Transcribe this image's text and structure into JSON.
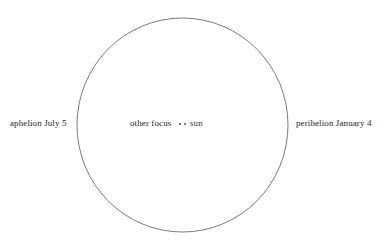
{
  "figure": {
    "background_color": "#ffffff",
    "width": 385,
    "height": 247
  },
  "orbit": {
    "shape": "ellipse",
    "stroke_color": "#6e6c6c",
    "stroke_width": 0.9,
    "fill": "none",
    "center_x": 182.5,
    "center_y": 125,
    "radius_x": 105.5,
    "radius_y": 107
  },
  "labels": {
    "aphelion": "aphelion July 5",
    "perihelion": "perihelion January 4",
    "other_focus": "other focus",
    "sun": "sun"
  },
  "foci": [
    {
      "name": "other-focus",
      "marker": "dot",
      "color": "#4a4848"
    },
    {
      "name": "sun",
      "marker": "dot",
      "color": "#4a4848"
    }
  ],
  "chart_data": {
    "type": "scatter",
    "xlabel": "",
    "ylabel": "",
    "annotations": [
      {
        "text": "aphelion July 5",
        "position": "left-outside",
        "x": 10,
        "y": 124
      },
      {
        "text": "other focus",
        "position": "center-left",
        "x": 130,
        "y": 124
      },
      {
        "text": "sun",
        "position": "center-right",
        "x": 190,
        "y": 124
      },
      {
        "text": "perihelion January 4",
        "position": "right-outside",
        "x": 296,
        "y": 124
      }
    ],
    "series": [
      {
        "name": "orbit path",
        "type": "ellipse",
        "center": [
          182.5,
          125
        ],
        "semi_major_axis": 107,
        "semi_minor_axis": 105.5
      },
      {
        "name": "foci",
        "type": "scatter",
        "x": [
          180,
          185
        ],
        "y": [
          124,
          124
        ]
      }
    ],
    "grid": false,
    "legend": false
  }
}
